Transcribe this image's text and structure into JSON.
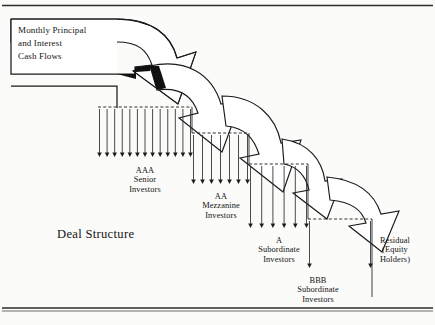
{
  "figure": {
    "title_label": "Deal Structure",
    "source_box": {
      "text": "Monthly Principal\nand Interest\nCash Flows"
    },
    "frame": {
      "top_rule_y": 5,
      "bottom_rule_y": 308,
      "rule_color": "#2b2b2b"
    },
    "palette": {
      "ink": "#1a1a1a",
      "paper": "#fbfbf9",
      "arrow_fill": "#ffffff",
      "arrow_stroke": "#1a1a1a",
      "dashed_stroke": "#1a1a1a"
    },
    "tranches": [
      {
        "id": "aaa",
        "label": "AAA\nSenior\nInvestors",
        "rating": "AAA",
        "class_name": "Senior",
        "holder": "Investors",
        "arrow_count": 13,
        "dash_x0": 98,
        "dash_x1": 192,
        "dash_y": 107,
        "arrow_y1": 157,
        "label_x": 145,
        "label_y": 166
      },
      {
        "id": "aa",
        "label": "AA\nMezzanine\nInvestors",
        "rating": "AA",
        "class_name": "Mezzanine",
        "holder": "Investors",
        "arrow_count": 7,
        "dash_x0": 192,
        "dash_x1": 249,
        "dash_y": 133,
        "arrow_y1": 184,
        "label_x": 221,
        "label_y": 192
      },
      {
        "id": "a",
        "label": "A\nSubordinate\nInvestors",
        "rating": "A",
        "class_name": "Subordinate",
        "holder": "Investors",
        "arrow_count": 6,
        "dash_x0": 249,
        "dash_x1": 308,
        "dash_y": 164,
        "arrow_y1": 228,
        "label_x": 279,
        "label_y": 236
      },
      {
        "id": "bbb",
        "label": "BBB\nSubordinate\nInvestors",
        "rating": "BBB",
        "class_name": "Subordinate",
        "holder": "Investors",
        "arrow_count": 2,
        "dash_x0": 308,
        "dash_x1": 372,
        "dash_y": 219,
        "arrow_y1": 268,
        "label_x": 318,
        "label_y": 276
      },
      {
        "id": "residual",
        "label": "Residual\n(Equity\nHolders)",
        "rating": "Residual",
        "class_name": "Equity",
        "holder": "Holders",
        "arrow_count": 0,
        "label_x": 395,
        "label_y": 236
      }
    ],
    "flow_arrows": [
      {
        "id": "flow-to-aaa",
        "from": "source",
        "to": "aaa"
      },
      {
        "id": "flow-to-aa",
        "from": "aaa",
        "to": "aa"
      },
      {
        "id": "flow-to-a",
        "from": "aa",
        "to": "a"
      },
      {
        "id": "flow-to-bbb",
        "from": "a",
        "to": "bbb"
      },
      {
        "id": "flow-to-residual",
        "from": "bbb",
        "to": "residual"
      }
    ]
  }
}
